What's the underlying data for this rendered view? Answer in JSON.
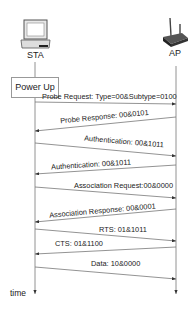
{
  "diagram": {
    "type": "sequence",
    "participants": [
      {
        "id": "sta",
        "label": "STA",
        "icon": "laptop-icon"
      },
      {
        "id": "ap",
        "label": "AP",
        "icon": "router-icon"
      }
    ],
    "start_event": "Power Up",
    "axis_label": "time",
    "messages": [
      {
        "from": "sta",
        "to": "ap",
        "label": "Probe Request: Type=00&Subtype=0100"
      },
      {
        "from": "ap",
        "to": "sta",
        "label": "Probe Response: 00&0101"
      },
      {
        "from": "sta",
        "to": "ap",
        "label": "Authentication: 00&1011"
      },
      {
        "from": "ap",
        "to": "sta",
        "label": "Authentication: 00&1011"
      },
      {
        "from": "sta",
        "to": "ap",
        "label": "Association Request:00&0000"
      },
      {
        "from": "ap",
        "to": "sta",
        "label": "Association Response: 00&0001"
      },
      {
        "from": "sta",
        "to": "ap",
        "label": "RTS: 01&1011"
      },
      {
        "from": "ap",
        "to": "sta",
        "label": "CTS: 01&1100"
      },
      {
        "from": "sta",
        "to": "ap",
        "label": "Data: 10&0000"
      }
    ]
  }
}
